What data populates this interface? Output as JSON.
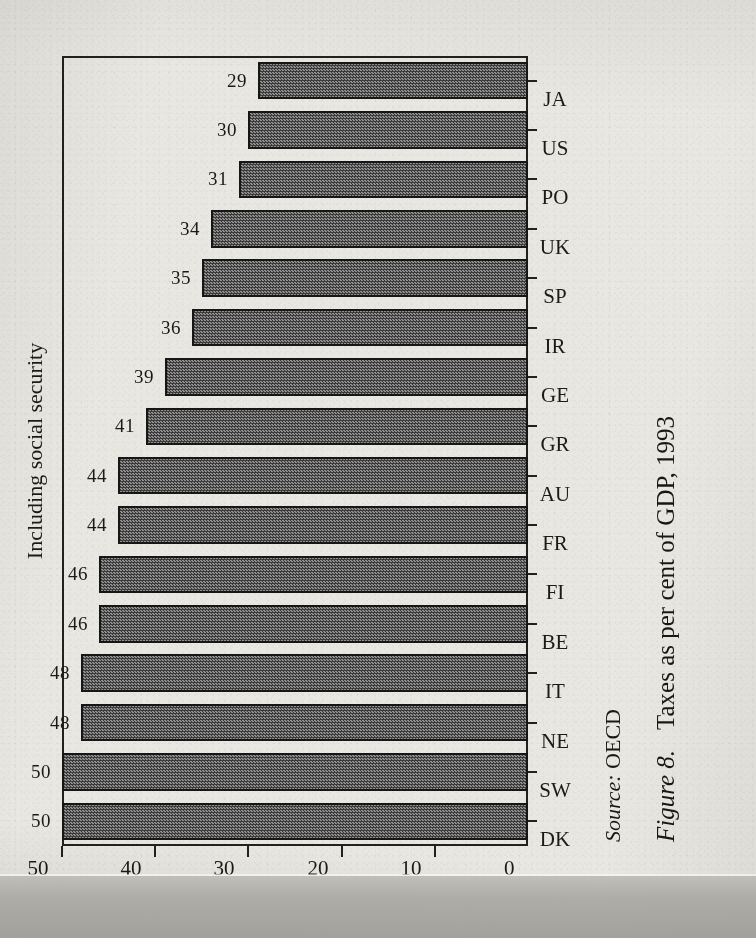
{
  "page": {
    "background_color": "#e9e7e2",
    "ink_color": "#1b1a18"
  },
  "chart_data": {
    "type": "bar",
    "orientation": "vertical",
    "title": "Including social security",
    "xlabel": "",
    "ylabel": "",
    "ylim": [
      0,
      50
    ],
    "yticks": [
      0,
      10,
      20,
      30,
      40,
      50
    ],
    "ytick_labels": [
      "0",
      "10",
      "20",
      "30",
      "40",
      "50"
    ],
    "grid": false,
    "legend": null,
    "categories": [
      "DK",
      "SW",
      "NE",
      "IT",
      "BE",
      "FI",
      "FR",
      "AU",
      "GR",
      "GE",
      "IR",
      "SP",
      "UK",
      "PO",
      "US",
      "JA"
    ],
    "values": [
      50,
      50,
      48,
      48,
      46,
      46,
      44,
      44,
      41,
      39,
      36,
      35,
      34,
      31,
      30,
      29
    ],
    "data_labels": [
      "50",
      "50",
      "48",
      "48",
      "46",
      "46",
      "44",
      "44",
      "41",
      "39",
      "36",
      "35",
      "34",
      "31",
      "30",
      "29"
    ],
    "bar_fill_color": "#6a6a6a",
    "bar_edge_color": "#171614"
  },
  "source": {
    "lead": "Source:",
    "text": "OECD"
  },
  "caption": {
    "figure_number": "Figure 8.",
    "text": "Taxes as per cent of GDP, 1993"
  }
}
